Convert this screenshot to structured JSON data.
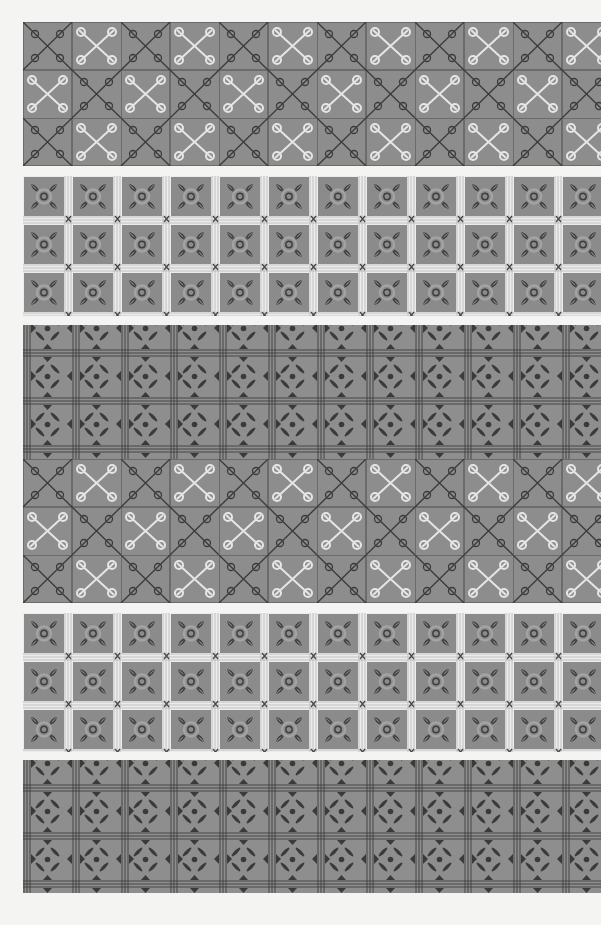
{
  "page": {
    "background": "#f4f4f2",
    "tile_color": "#8d8d8d",
    "dark_line_color": "#3a3a3a",
    "light_line_color": "#e6e6e6"
  },
  "bands": [
    {
      "id": "band-1",
      "pattern": "x-chain",
      "top": 22,
      "height": 144,
      "rows": 3
    },
    {
      "id": "band-2",
      "pattern": "star-tiles",
      "top": 176,
      "height": 140,
      "rows": 3
    },
    {
      "id": "band-3",
      "pattern": "floral-and-x-chain",
      "top": 325,
      "height": 278,
      "rows": 6
    },
    {
      "id": "band-4",
      "pattern": "star-tiles",
      "top": 613,
      "height": 139,
      "rows": 3
    },
    {
      "id": "band-5",
      "pattern": "floral",
      "top": 760,
      "height": 133,
      "rows": 3
    }
  ]
}
